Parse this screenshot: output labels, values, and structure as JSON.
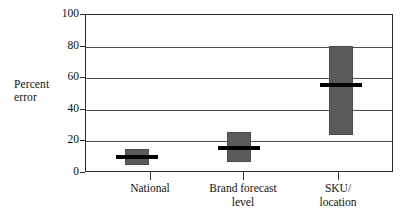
{
  "chart_data": {
    "type": "bar",
    "title": "",
    "subtitle": "",
    "xlabel": "",
    "ylabel": "Percent error",
    "ylabel_lines": [
      "Percent",
      "error"
    ],
    "ylim": [
      0,
      100
    ],
    "yticks": [
      0,
      20,
      40,
      60,
      80,
      100
    ],
    "ytick_labels": [
      "0",
      "20",
      "40",
      "60",
      "80",
      "100"
    ],
    "grid": true,
    "grid_axis": "y",
    "legend": false,
    "legend_position": "none",
    "categories": [
      "National",
      "Brand forecast level",
      "SKU/ location"
    ],
    "category_label_lines": [
      [
        "National"
      ],
      [
        "Brand forecast",
        "level"
      ],
      [
        "SKU/",
        "location"
      ]
    ],
    "series": [
      {
        "name": "Percent error range",
        "bars": [
          {
            "category": "National",
            "low": 4,
            "high": 14,
            "median": 9
          },
          {
            "category": "Brand forecast level",
            "low": 6,
            "high": 25,
            "median": 15
          },
          {
            "category": "SKU/ location",
            "low": 23,
            "high": 80,
            "median": 55
          }
        ]
      }
    ],
    "values": [
      9,
      15,
      55
    ],
    "colors": {
      "bar_fill": "#5a5a5a",
      "bar_edge": "#4a4a4a",
      "median_line": "#000000",
      "gridline": "#4d4d4d",
      "axis": "#2a2a2a",
      "background": "#ffffff",
      "text": "#111111"
    }
  }
}
